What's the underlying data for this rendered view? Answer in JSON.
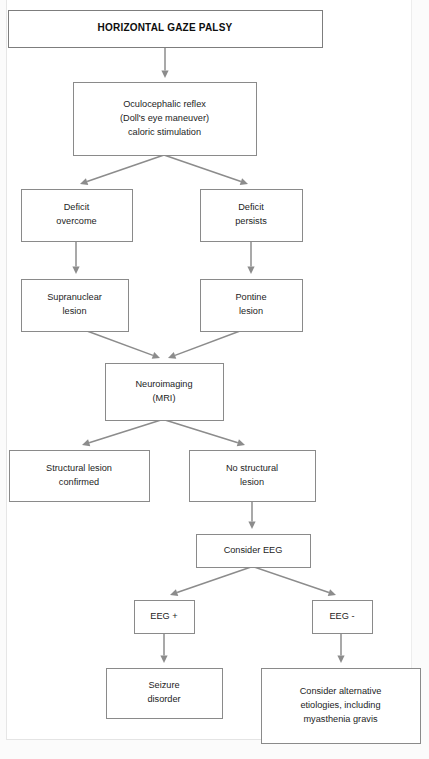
{
  "document": {
    "kind": "clinical-flowchart",
    "title": "HORIZONTAL GAZE PALSY"
  },
  "colors": {
    "box_border": "#8a8a8a",
    "connector": "#8c8c8c",
    "text": "#1d1d1d",
    "title_text": "#0e0e0e",
    "page_background": "#ffffff",
    "canvas_background": "#fbfbfb"
  },
  "chart_data": {
    "type": "diagram",
    "title": "HORIZONTAL GAZE PALSY",
    "orientation": "top-down",
    "nodes": [
      {
        "id": "title",
        "label": "HORIZONTAL GAZE PALSY",
        "lines": [
          "HORIZONTAL GAZE PALSY"
        ],
        "x": 8,
        "y": 10,
        "w": 314,
        "h": 37,
        "style": "title"
      },
      {
        "id": "oculocephalic",
        "label": "Oculocephalic reflex (Doll's eye maneuver) caloric stimulation",
        "lines": [
          "Oculocephalic reflex",
          "(Doll's eye maneuver)",
          "caloric stimulation"
        ],
        "x": 73,
        "y": 82,
        "w": 183,
        "h": 73,
        "style": "normal"
      },
      {
        "id": "deficit-overcome",
        "label": "Deficit overcome",
        "lines": [
          "Deficit",
          "overcome"
        ],
        "x": 21,
        "y": 189,
        "w": 111,
        "h": 52,
        "style": "normal"
      },
      {
        "id": "deficit-persists",
        "label": "Deficit persists",
        "lines": [
          "Deficit",
          "persists"
        ],
        "x": 200,
        "y": 189,
        "w": 102,
        "h": 52,
        "style": "normal"
      },
      {
        "id": "supranuclear-lesion",
        "label": "Supranuclear lesion",
        "lines": [
          "Supranuclear",
          "lesion"
        ],
        "x": 21,
        "y": 279,
        "w": 107,
        "h": 52,
        "style": "normal"
      },
      {
        "id": "pontine-lesion",
        "label": "Pontine lesion",
        "lines": [
          "Pontine",
          "lesion"
        ],
        "x": 200,
        "y": 279,
        "w": 102,
        "h": 52,
        "style": "normal"
      },
      {
        "id": "neuroimaging",
        "label": "Neuroimaging (MRI)",
        "lines": [
          "Neuroimaging",
          "(MRI)"
        ],
        "x": 105,
        "y": 363,
        "w": 118,
        "h": 57,
        "style": "normal"
      },
      {
        "id": "structural-lesion-confirmed",
        "label": "Structural lesion confirmed",
        "lines": [
          "Structural lesion",
          "confirmed"
        ],
        "x": 9,
        "y": 450,
        "w": 140,
        "h": 51,
        "style": "normal"
      },
      {
        "id": "no-structural-lesion",
        "label": "No structural lesion",
        "lines": [
          "No structural",
          "lesion"
        ],
        "x": 189,
        "y": 450,
        "w": 126,
        "h": 51,
        "style": "normal"
      },
      {
        "id": "consider-eeg",
        "label": "Consider EEG",
        "lines": [
          "Consider EEG"
        ],
        "x": 196,
        "y": 534,
        "w": 114,
        "h": 33,
        "style": "normal"
      },
      {
        "id": "eeg-positive",
        "label": "EEG +",
        "lines": [
          "EEG +"
        ],
        "x": 134,
        "y": 600,
        "w": 60,
        "h": 33,
        "style": "normal"
      },
      {
        "id": "eeg-negative",
        "label": "EEG -",
        "lines": [
          "EEG -"
        ],
        "x": 312,
        "y": 600,
        "w": 60,
        "h": 33,
        "style": "normal"
      },
      {
        "id": "seizure-disorder",
        "label": "Seizure disorder",
        "lines": [
          "Seizure",
          "disorder"
        ],
        "x": 106,
        "y": 668,
        "w": 116,
        "h": 50,
        "style": "normal"
      },
      {
        "id": "consider-alternative-etiologies",
        "label": "Consider alternative etiologies, including myasthenia gravis",
        "lines": [
          "Consider alternative",
          "etiologies, including",
          "myasthenia gravis"
        ],
        "x": 261,
        "y": 668,
        "w": 159,
        "h": 75,
        "style": "normal"
      }
    ],
    "edges": [
      {
        "from": "title",
        "to": "oculocephalic",
        "path": "M 165,47 L 165,78",
        "label": ""
      },
      {
        "from": "oculocephalic",
        "to": "deficit-overcome",
        "path": "M 164,155 L 80,184",
        "label": ""
      },
      {
        "from": "oculocephalic",
        "to": "deficit-persists",
        "path": "M 164,155 L 248,184",
        "label": ""
      },
      {
        "from": "deficit-overcome",
        "to": "supranuclear-lesion",
        "path": "M 76,241 L 76,274",
        "label": ""
      },
      {
        "from": "deficit-persists",
        "to": "pontine-lesion",
        "path": "M 251,241 L 251,274",
        "label": ""
      },
      {
        "from": "supranuclear-lesion",
        "to": "neuroimaging",
        "path": "M 87,331 L 160,358",
        "label": ""
      },
      {
        "from": "pontine-lesion",
        "to": "neuroimaging",
        "path": "M 240,331 L 168,358",
        "label": ""
      },
      {
        "from": "neuroimaging",
        "to": "structural-lesion-confirmed",
        "path": "M 161,420 L 82,445",
        "label": ""
      },
      {
        "from": "neuroimaging",
        "to": "no-structural-lesion",
        "path": "M 165,420 L 245,445",
        "label": ""
      },
      {
        "from": "no-structural-lesion",
        "to": "consider-eeg",
        "path": "M 252,501 L 252,529",
        "label": ""
      },
      {
        "from": "consider-eeg",
        "to": "eeg-positive",
        "path": "M 251,567 L 170,595",
        "label": ""
      },
      {
        "from": "consider-eeg",
        "to": "eeg-negative",
        "path": "M 254,567 L 336,595",
        "label": ""
      },
      {
        "from": "eeg-positive",
        "to": "seizure-disorder",
        "path": "M 164,633 L 164,663",
        "label": ""
      },
      {
        "from": "eeg-negative",
        "to": "consider-alternative-etiologies",
        "path": "M 341,633 L 341,663",
        "label": ""
      }
    ]
  }
}
